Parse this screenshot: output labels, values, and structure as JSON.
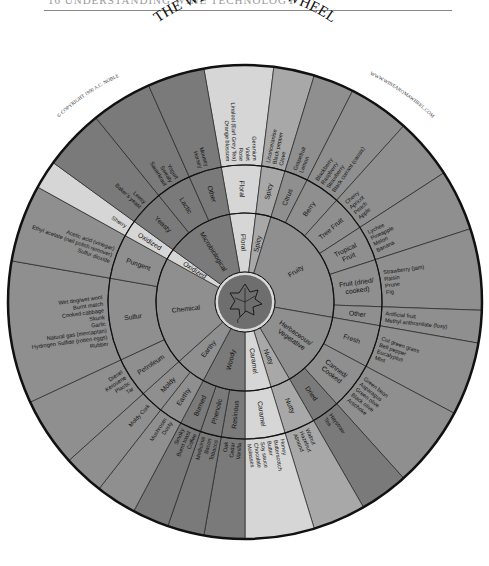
{
  "page": {
    "header_partial": "16  UNDERSTANDING WINE TECHNOLOGY",
    "title": "THE WINE AROMA WHEEL",
    "copyright": "© COPYRIGHT 1990 A.C. NOBLE",
    "website": "WWW.WINEAROMAWHEEL.COM"
  },
  "colors": {
    "dark": "#7a7a7a",
    "mid": "#8f8f8f",
    "medium_light": "#a8a8a8",
    "light": "#d6d6d6",
    "outline": "#111111",
    "center": "#6e6e6e"
  },
  "geometry": {
    "cx": 245,
    "cy": 302,
    "r_center": 30,
    "r1": 89,
    "r2": 137,
    "r3": 237
  },
  "wheel": {
    "tier1": [
      {
        "label": "Floral",
        "start": -10,
        "end": 7,
        "shade": "light"
      },
      {
        "label": "Spicy",
        "start": 7,
        "end": 17,
        "shade": "medium_light"
      },
      {
        "label": "Fruity",
        "start": 17,
        "end": 100,
        "shade": "mid"
      },
      {
        "label": "Herbaceous/ Vegetative",
        "start": 100,
        "end": 150,
        "shade": "mid"
      },
      {
        "label": "Nutty",
        "start": 150,
        "end": 163,
        "shade": "medium_light"
      },
      {
        "label": "Caramel",
        "start": 163,
        "end": 180,
        "shade": "light"
      },
      {
        "label": "Woody",
        "start": 180,
        "end": 208,
        "shade": "dark"
      },
      {
        "label": "Earthy",
        "start": 208,
        "end": 228,
        "shade": "mid"
      },
      {
        "label": "Chemical",
        "start": 228,
        "end": 299,
        "shade": "mid"
      },
      {
        "label": "Oxidized",
        "start": 299,
        "end": 306,
        "shade": "light"
      },
      {
        "label": "Microbiological",
        "start": 306,
        "end": 350,
        "shade": "dark"
      }
    ],
    "tier2": [
      {
        "label": "Floral",
        "start": -10,
        "end": 7,
        "shade": "light"
      },
      {
        "label": "Spicy",
        "start": 7,
        "end": 17,
        "shade": "medium_light"
      },
      {
        "label": "Citrus",
        "start": 17,
        "end": 27,
        "shade": "mid"
      },
      {
        "label": "Berry",
        "start": 27,
        "end": 42,
        "shade": "mid"
      },
      {
        "label": "Tree Fruit",
        "start": 42,
        "end": 57,
        "shade": "mid"
      },
      {
        "label": "Tropical Fruit",
        "start": 57,
        "end": 72,
        "shade": "mid"
      },
      {
        "label": "Fruit (dried/ cooked)",
        "start": 72,
        "end": 92,
        "shade": "mid"
      },
      {
        "label": "Other",
        "start": 92,
        "end": 100,
        "shade": "mid"
      },
      {
        "label": "Fresh",
        "start": 100,
        "end": 118,
        "shade": "mid"
      },
      {
        "label": "Canned/ Cooked",
        "start": 118,
        "end": 138,
        "shade": "mid"
      },
      {
        "label": "Dried",
        "start": 138,
        "end": 150,
        "shade": "dark"
      },
      {
        "label": "Nutty",
        "start": 150,
        "end": 163,
        "shade": "medium_light"
      },
      {
        "label": "Caramel",
        "start": 163,
        "end": 180,
        "shade": "light"
      },
      {
        "label": "Resinous",
        "start": 180,
        "end": 190,
        "shade": "dark"
      },
      {
        "label": "Phenolic",
        "start": 190,
        "end": 199,
        "shade": "dark"
      },
      {
        "label": "Burned",
        "start": 199,
        "end": 208,
        "shade": "dark"
      },
      {
        "label": "Earthy",
        "start": 208,
        "end": 218,
        "shade": "mid"
      },
      {
        "label": "Moldy",
        "start": 218,
        "end": 228,
        "shade": "mid"
      },
      {
        "label": "Petroleum",
        "start": 228,
        "end": 245,
        "shade": "mid"
      },
      {
        "label": "Sulfur",
        "start": 245,
        "end": 280,
        "shade": "mid"
      },
      {
        "label": "Pungent",
        "start": 280,
        "end": 299,
        "shade": "mid"
      },
      {
        "label": "Oxidized",
        "start": 299,
        "end": 306,
        "shade": "light"
      },
      {
        "label": "Yeasty",
        "start": 306,
        "end": 321,
        "shade": "dark"
      },
      {
        "label": "Lactic",
        "start": 321,
        "end": 336,
        "shade": "dark"
      },
      {
        "label": "Other",
        "start": 336,
        "end": 350,
        "shade": "dark"
      }
    ],
    "tier3": [
      {
        "items": [
          "Orange blossom",
          "Linalool (Earl Grey Tea)",
          "Rose",
          "Violet",
          "Geranium"
        ],
        "start": -10,
        "end": 7,
        "shade": "light"
      },
      {
        "items": [
          "Licorice/anise",
          "Black pepper",
          "Clove"
        ],
        "start": 7,
        "end": 17,
        "shade": "medium_light"
      },
      {
        "items": [
          "Grapefruit",
          "Lemon"
        ],
        "start": 17,
        "end": 27,
        "shade": "mid"
      },
      {
        "items": [
          "Blackberry",
          "Raspberry",
          "Strawberry",
          "Black currant (cassis)"
        ],
        "start": 27,
        "end": 42,
        "shade": "mid"
      },
      {
        "items": [
          "Cherry",
          "Apricot",
          "Peach",
          "Apple"
        ],
        "start": 42,
        "end": 57,
        "shade": "mid"
      },
      {
        "items": [
          "Lychee",
          "Pineapple",
          "Melon",
          "Banana"
        ],
        "start": 57,
        "end": 72,
        "shade": "mid"
      },
      {
        "items": [
          "Strawberry (jam)",
          "Raisin",
          "Prune",
          "Fig"
        ],
        "start": 72,
        "end": 92,
        "shade": "mid"
      },
      {
        "items": [
          "Artificial fruit",
          "Methyl anthranilate (foxy)"
        ],
        "start": 92,
        "end": 100,
        "shade": "mid"
      },
      {
        "items": [
          "Cut green grass",
          "Bell pepper",
          "Eucalyptus",
          "Mint"
        ],
        "start": 100,
        "end": 118,
        "shade": "mid"
      },
      {
        "items": [
          "Green bean",
          "Asparagus",
          "Green olive",
          "Black olive",
          "Artichoke"
        ],
        "start": 118,
        "end": 138,
        "shade": "mid"
      },
      {
        "items": [
          "Haystraw",
          "Tea"
        ],
        "start": 138,
        "end": 150,
        "shade": "dark"
      },
      {
        "items": [
          "Walnut",
          "Hazelnut",
          "Almond"
        ],
        "start": 150,
        "end": 163,
        "shade": "medium_light"
      },
      {
        "items": [
          "Honey",
          "Butterscotch",
          "Butter",
          "Soy sauce",
          "Chocolate",
          "Molasses"
        ],
        "start": 163,
        "end": 180,
        "shade": "light"
      },
      {
        "items": [
          "Vanilla",
          "Cedar",
          "Oak"
        ],
        "start": 180,
        "end": 190,
        "shade": "dark"
      },
      {
        "items": [
          "Tobacco",
          "Bacon",
          "Medicinal"
        ],
        "start": 190,
        "end": 199,
        "shade": "dark"
      },
      {
        "items": [
          "Coffee",
          "Burnt toast",
          "Smoky"
        ],
        "start": 199,
        "end": 208,
        "shade": "dark"
      },
      {
        "items": [
          "Dusty",
          "Mushroom"
        ],
        "start": 208,
        "end": 218,
        "shade": "mid"
      },
      {
        "items": [
          "Moldy Cork"
        ],
        "start": 218,
        "end": 228,
        "shade": "mid"
      },
      {
        "items": [
          "Tar",
          "Plastic",
          "Kerosene",
          "Diesel"
        ],
        "start": 228,
        "end": 245,
        "shade": "mid"
      },
      {
        "items": [
          "Rubber",
          "Hydrogen Sulfide (rotten eggs)",
          "Natural gas (mercaptan)",
          "Garlic",
          "Skunk",
          "Cooked cabbage",
          "Burnt match",
          "Wet dog/wet wool"
        ],
        "start": 245,
        "end": 280,
        "shade": "mid"
      },
      {
        "items": [
          "Sulfur dioxide",
          "Ethyl acetate (nail polish remover)",
          "Acetic acid (vinegar)"
        ],
        "start": 280,
        "end": 299,
        "shade": "mid"
      },
      {
        "items": [
          "Sherry"
        ],
        "start": 299,
        "end": 306,
        "shade": "light"
      },
      {
        "items": [
          "Baker's yeast",
          "Leesy"
        ],
        "start": 306,
        "end": 321,
        "shade": "dark"
      },
      {
        "items": [
          "Sauerkraut",
          "Sweaty",
          "Yogurt"
        ],
        "start": 321,
        "end": 336,
        "shade": "dark"
      },
      {
        "items": [
          "Horsey",
          "Mousey"
        ],
        "start": 336,
        "end": 350,
        "shade": "dark"
      }
    ]
  }
}
